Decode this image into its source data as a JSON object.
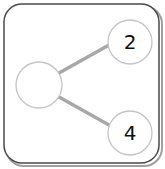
{
  "diagram": {
    "type": "tree",
    "colors": {
      "card_border": "#4a4a4a",
      "card_shadow": "#9a9a9a",
      "node_stroke": "#c4c4c4",
      "node_fill": "#ffffff",
      "edge": "#a8a8a8",
      "label": "#111111"
    },
    "nodes": [
      {
        "id": "root",
        "label": ""
      },
      {
        "id": "child-top",
        "label": "2"
      },
      {
        "id": "child-bottom",
        "label": "4"
      }
    ],
    "edges": [
      {
        "from": "root",
        "to": "child-top"
      },
      {
        "from": "root",
        "to": "child-bottom"
      }
    ]
  }
}
